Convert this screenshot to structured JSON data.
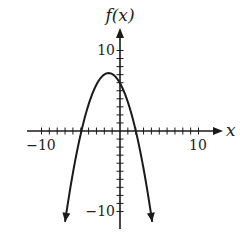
{
  "chart_data": {
    "type": "line",
    "title": "",
    "xlabel": "x",
    "ylabel": "f(x)",
    "xlim": [
      -11.9,
      12.9
    ],
    "ylim": [
      -12.1,
      12.8
    ],
    "x_ticks": {
      "min": -10,
      "max": 10,
      "step": 1,
      "labeled": [
        -10,
        10
      ]
    },
    "y_ticks": {
      "min": -10,
      "max": 10,
      "step": 1,
      "labeled": [
        -10,
        10
      ]
    },
    "tick_labels": {
      "x_neg": "−10",
      "x_pos": "10",
      "y_pos": "10",
      "y_neg": "−10"
    },
    "grid": false,
    "legend": null,
    "series": [
      {
        "name": "f(x)",
        "description": "Downward-opening parabola with arrows at both ends",
        "equation_estimate": "f(x) = -0.6(x + 1.45)^2 + 7.2",
        "vertex": [
          -1.45,
          7.2
        ],
        "x_intercepts": [
          -4.9,
          2.0
        ],
        "y_intercept": 5.9,
        "endpoints": [
          [
            -7.0,
            -11.4
          ],
          [
            4.1,
            -11.4
          ]
        ],
        "points": [
          {
            "x": -7.0,
            "y": -11.4
          },
          {
            "x": -6.0,
            "y": -5.2
          },
          {
            "x": -5.0,
            "y": -0.4
          },
          {
            "x": -4.0,
            "y": 3.3
          },
          {
            "x": -3.0,
            "y": 5.8
          },
          {
            "x": -2.0,
            "y": 7.0
          },
          {
            "x": -1.45,
            "y": 7.2
          },
          {
            "x": -1.0,
            "y": 7.1
          },
          {
            "x": 0.0,
            "y": 5.9
          },
          {
            "x": 1.0,
            "y": 3.6
          },
          {
            "x": 2.0,
            "y": 0.0
          },
          {
            "x": 3.0,
            "y": -4.7
          },
          {
            "x": 4.1,
            "y": -11.4
          }
        ]
      }
    ],
    "style": {
      "line_color": "#1a1a1a",
      "axis_color": "#1a1a1a",
      "background": "#ffffff"
    }
  }
}
